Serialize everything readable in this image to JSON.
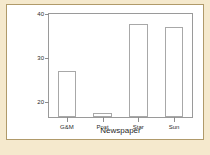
{
  "chart_data": {
    "type": "bar",
    "title": "",
    "xlabel": "Newspaper",
    "ylabel": "Sum of Blue",
    "categories": [
      "G&M",
      "Post",
      "Star",
      "Sun"
    ],
    "values": [
      27,
      17.5,
      37.8,
      37
    ],
    "ylim": [
      16.7,
      40
    ],
    "yticks": [
      20,
      30,
      40
    ],
    "ytick_labels": [
      "20",
      "30",
      "40"
    ],
    "grid": false,
    "legend": null,
    "bar_fill": "#ffffff",
    "bar_border": "#a8a8a8",
    "axis_color": "#9a9a9a",
    "plot_background": "#ffffff",
    "page_background": "#f5e9cd",
    "frame_border": "#b09a6a"
  }
}
